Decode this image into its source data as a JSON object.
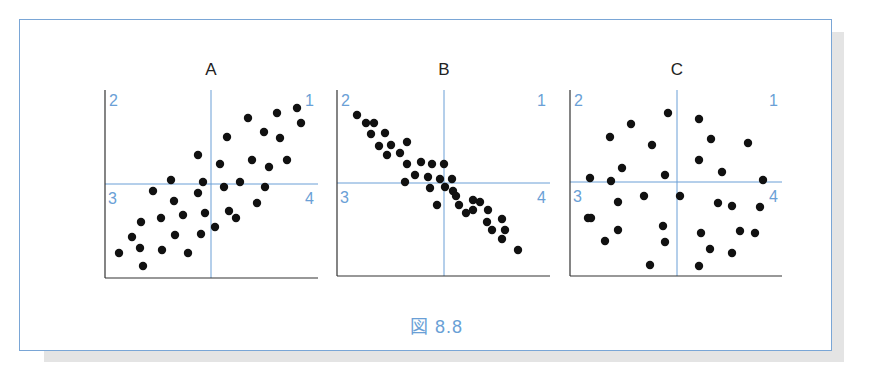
{
  "figure": {
    "caption": "図 8.8",
    "accent_color": "#6a9fd6",
    "point_color": "#111111",
    "axis_color": "#333333"
  },
  "chart_data": [
    {
      "type": "scatter",
      "title": "A",
      "description": "Positive correlation",
      "quadrant_labels": {
        "top_left": "2",
        "top_right": "1",
        "bottom_left": "3",
        "bottom_right": "4"
      },
      "frame": {
        "left": 105,
        "right": 318,
        "top": 90,
        "bottom": 278,
        "cx": 211,
        "cy": 184
      },
      "points": [
        [
          119,
          253
        ],
        [
          143,
          266
        ],
        [
          132,
          237
        ],
        [
          140,
          248
        ],
        [
          141,
          222
        ],
        [
          162,
          250
        ],
        [
          175,
          235
        ],
        [
          188,
          253
        ],
        [
          161,
          218
        ],
        [
          183,
          215
        ],
        [
          201,
          234
        ],
        [
          205,
          213
        ],
        [
          215,
          227
        ],
        [
          153,
          191
        ],
        [
          174,
          201
        ],
        [
          198,
          193
        ],
        [
          171,
          180
        ],
        [
          203,
          182
        ],
        [
          224,
          187
        ],
        [
          240,
          182
        ],
        [
          229,
          211
        ],
        [
          236,
          218
        ],
        [
          257,
          203
        ],
        [
          265,
          187
        ],
        [
          198,
          155
        ],
        [
          220,
          164
        ],
        [
          252,
          160
        ],
        [
          269,
          167
        ],
        [
          287,
          160
        ],
        [
          227,
          137
        ],
        [
          248,
          118
        ],
        [
          264,
          132
        ],
        [
          280,
          138
        ],
        [
          277,
          113
        ],
        [
          297,
          108
        ],
        [
          301,
          123
        ]
      ]
    },
    {
      "type": "scatter",
      "title": "B",
      "description": "Negative correlation",
      "quadrant_labels": {
        "top_left": "2",
        "top_right": "1",
        "bottom_left": "3",
        "bottom_right": "4"
      },
      "frame": {
        "left": 337,
        "right": 550,
        "top": 90,
        "bottom": 276,
        "cx": 444,
        "cy": 183
      },
      "points": [
        [
          357,
          115
        ],
        [
          366,
          123
        ],
        [
          374,
          123
        ],
        [
          371,
          134
        ],
        [
          385,
          133
        ],
        [
          379,
          146
        ],
        [
          391,
          145
        ],
        [
          407,
          142
        ],
        [
          387,
          155
        ],
        [
          400,
          153
        ],
        [
          407,
          164
        ],
        [
          405,
          182
        ],
        [
          421,
          162
        ],
        [
          432,
          164
        ],
        [
          444,
          164
        ],
        [
          415,
          175
        ],
        [
          428,
          177
        ],
        [
          440,
          179
        ],
        [
          452,
          179
        ],
        [
          430,
          188
        ],
        [
          445,
          187
        ],
        [
          453,
          191
        ],
        [
          456,
          196
        ],
        [
          437,
          205
        ],
        [
          459,
          205
        ],
        [
          466,
          213
        ],
        [
          473,
          200
        ],
        [
          480,
          202
        ],
        [
          473,
          210
        ],
        [
          488,
          210
        ],
        [
          487,
          222
        ],
        [
          502,
          219
        ],
        [
          492,
          230
        ],
        [
          505,
          230
        ],
        [
          502,
          239
        ],
        [
          518,
          250
        ]
      ]
    },
    {
      "type": "scatter",
      "title": "C",
      "description": "No correlation",
      "quadrant_labels": {
        "top_left": "2",
        "top_right": "1",
        "bottom_left": "3",
        "bottom_right": "4"
      },
      "frame": {
        "left": 570,
        "right": 782,
        "top": 90,
        "bottom": 276,
        "cx": 677,
        "cy": 182
      },
      "points": [
        [
          590,
          178
        ],
        [
          611,
          181
        ],
        [
          610,
          137
        ],
        [
          631,
          124
        ],
        [
          652,
          145
        ],
        [
          622,
          168
        ],
        [
          668,
          113
        ],
        [
          665,
          175
        ],
        [
          699,
          119
        ],
        [
          711,
          139
        ],
        [
          748,
          143
        ],
        [
          699,
          160
        ],
        [
          722,
          172
        ],
        [
          763,
          180
        ],
        [
          588,
          218
        ],
        [
          618,
          202
        ],
        [
          644,
          196
        ],
        [
          680,
          196
        ],
        [
          718,
          203
        ],
        [
          732,
          206
        ],
        [
          760,
          207
        ],
        [
          591,
          218
        ],
        [
          618,
          230
        ],
        [
          663,
          226
        ],
        [
          701,
          233
        ],
        [
          740,
          231
        ],
        [
          755,
          233
        ],
        [
          605,
          241
        ],
        [
          665,
          242
        ],
        [
          710,
          249
        ],
        [
          732,
          253
        ],
        [
          650,
          265
        ],
        [
          699,
          266
        ]
      ]
    }
  ]
}
